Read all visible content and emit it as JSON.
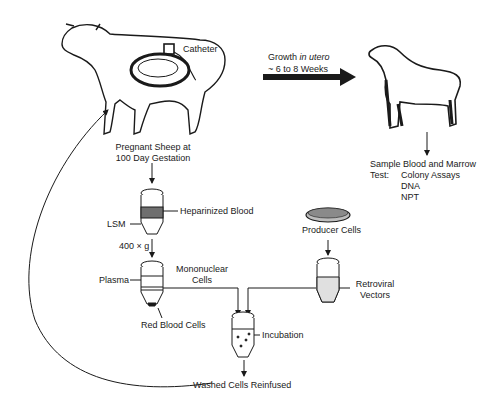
{
  "diagram": {
    "sheep_labels": {
      "catheter": "Catheter",
      "pregnant_line1": "Pregnant Sheep at",
      "pregnant_line2": "100 Day Gestation"
    },
    "growth": {
      "prefix": "Growth ",
      "italic": "in utero",
      "duration": "~ 6 to 8 Weeks"
    },
    "lamb_test": {
      "sample": "Sample Blood and Marrow",
      "test_label": "Test:",
      "tests": [
        "Colony Assays",
        "DNA",
        "NPT"
      ]
    },
    "tube1": {
      "heparinized": "Heparinized Blood",
      "lsm": "LSM",
      "centrifuge": "400 × g"
    },
    "tube2": {
      "plasma": "Plasma",
      "mononuclear_line1": "Mononuclear",
      "mononuclear_line2": "Cells",
      "rbc": "Red Blood Cells"
    },
    "producer": {
      "label": "Producer Cells",
      "vectors_line1": "Retroviral",
      "vectors_line2": "Vectors"
    },
    "incubation": {
      "label": "Incubation",
      "result": "Washed Cells Reinfused"
    }
  }
}
